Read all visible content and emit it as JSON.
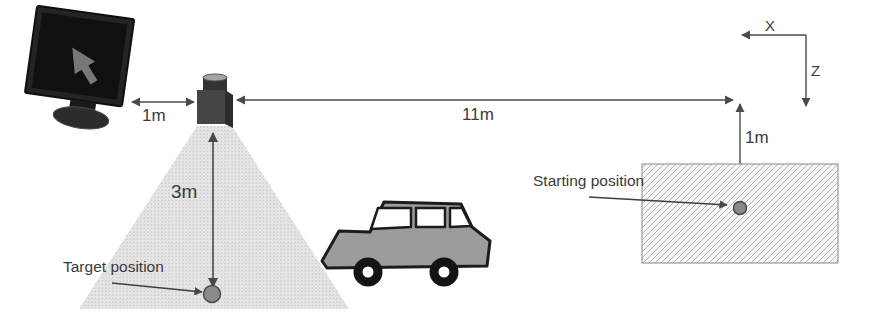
{
  "figure": {
    "measurements": {
      "monitor_to_sensor": "1m",
      "sensor_to_start_line": "11m",
      "sensor_to_target": "3m",
      "line_to_start": "1m"
    },
    "axes": {
      "x": "X",
      "z": "Z"
    },
    "annotations": {
      "target": "Target position",
      "starting": "Starting position"
    },
    "icons": {
      "monitor_screen": "up-left-arrow-icon",
      "sensor": "lidar-sensor",
      "vehicle": "car-side-view"
    },
    "colors": {
      "line": "#4a4a4a",
      "text": "#3b3b3b",
      "cone_fill": "#e9e9e9",
      "cone_dots": "#c2c2c2",
      "hatch_bg": "#f7f7f7",
      "hatch_line": "#b4b4b4",
      "marker_dot": "#8a8a8a",
      "car_body": "#9c9c9c",
      "monitor_screen": "#101010",
      "monitor_frame": "#242424",
      "monitor_arrow": "#777777",
      "sensor_front": "#454545",
      "sensor_side": "#2c2c2c",
      "sensor_cap": "#a5a5a5"
    }
  }
}
